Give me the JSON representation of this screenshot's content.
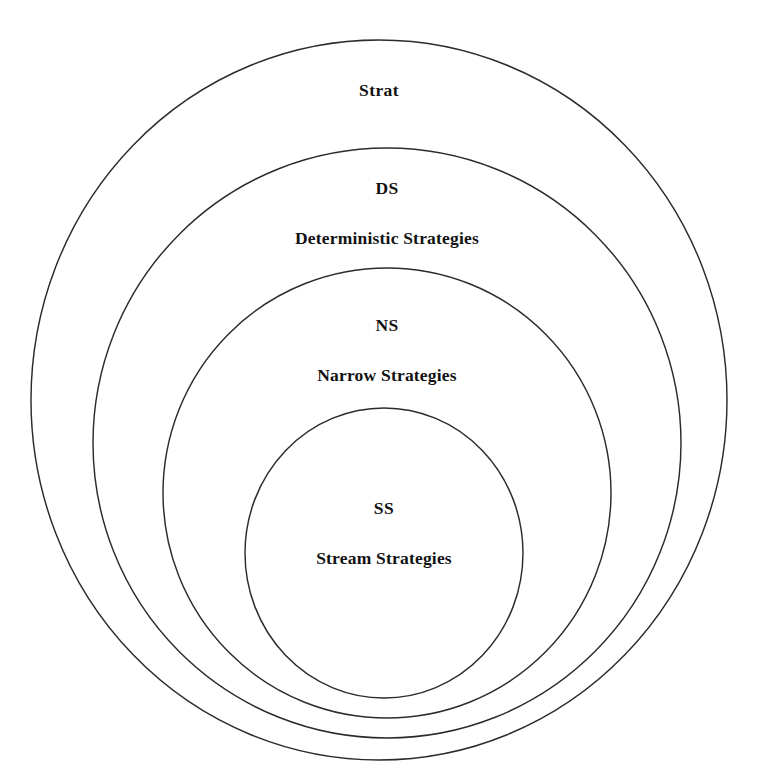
{
  "diagram": {
    "type": "nested-venn",
    "title_visible": false,
    "background_color": "#ffffff",
    "stroke_color": "#2b2b2b",
    "text_color": "#121212",
    "rings": [
      {
        "id": "strat",
        "abbrev": "Strat",
        "full_name": "",
        "has_full_name": false,
        "level": 1,
        "label_center_x": 379,
        "label_top_y": 80,
        "ellipse": {
          "cx": 379,
          "cy": 400,
          "rx": 348,
          "ry": 360
        }
      },
      {
        "id": "ds",
        "abbrev": "DS",
        "full_name": "Deterministic Strategies",
        "has_full_name": true,
        "level": 2,
        "label_center_x": 387,
        "label_top_y": 178,
        "ellipse": {
          "cx": 387,
          "cy": 443,
          "rx": 294,
          "ry": 295
        }
      },
      {
        "id": "ns",
        "abbrev": "NS",
        "full_name": "Narrow Strategies",
        "has_full_name": true,
        "level": 3,
        "label_center_x": 387,
        "label_top_y": 315,
        "ellipse": {
          "cx": 387,
          "cy": 493,
          "rx": 224,
          "ry": 225
        }
      },
      {
        "id": "ss",
        "abbrev": "SS",
        "full_name": "Stream Strategies",
        "has_full_name": true,
        "level": 4,
        "label_center_x": 384,
        "label_top_y": 498,
        "ellipse": {
          "cx": 384,
          "cy": 553,
          "rx": 139,
          "ry": 145
        }
      }
    ]
  }
}
